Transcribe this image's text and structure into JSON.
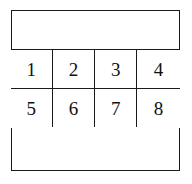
{
  "figure": {
    "kind": "numbered-cell-grid-diagram",
    "background_color": "#ffffff",
    "line_color": "#1a1a1a",
    "text_color": "#111111",
    "outer_frame": {
      "name": "outer-rectangle",
      "border_color": "#1a1a1a"
    },
    "bands": {
      "top_label": "",
      "bottom_label": ""
    },
    "grid": {
      "columns": 4,
      "rows": 2,
      "cells": [
        {
          "label": "1"
        },
        {
          "label": "2"
        },
        {
          "label": "3"
        },
        {
          "label": "4"
        },
        {
          "label": "5"
        },
        {
          "label": "6"
        },
        {
          "label": "7"
        },
        {
          "label": "8"
        }
      ]
    }
  }
}
